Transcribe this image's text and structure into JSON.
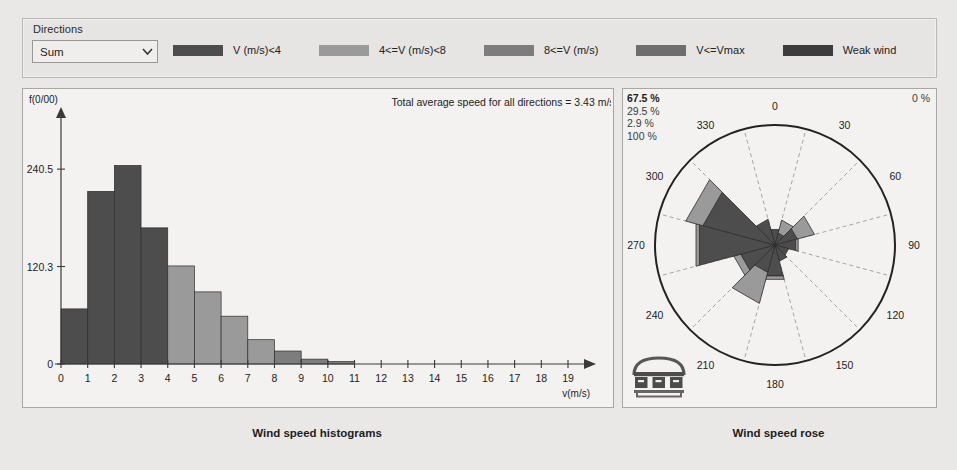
{
  "window": {
    "background": "#e9e8e6"
  },
  "controls": {
    "directions_label": "Directions",
    "direction_value": "Sum",
    "direction_options": [
      "Sum"
    ],
    "dropdown_icon": "chevron-down-icon"
  },
  "legend": {
    "items": [
      {
        "label": "V (m/s)<4",
        "color": "#4d4d4d"
      },
      {
        "label": "4<=V (m/s)<8",
        "color": "#9a9a9a"
      },
      {
        "label": "8<=V (m/s)",
        "color": "#7d7d7d"
      },
      {
        "label": "V<=Vmax",
        "color": "#6e6e6e"
      },
      {
        "label": "Weak wind",
        "color": "#3c3c3c"
      }
    ]
  },
  "histogram_panel": {
    "title": "Total average speed for all directions = 3.43 m/s",
    "caption": "Wind speed histograms"
  },
  "rose_panel": {
    "caption": "Wind speed rose",
    "stats": [
      "67.5 %",
      "29.5 %",
      "2.9 %",
      "100 %"
    ],
    "zero_label": "0 %",
    "logo_text": "mun"
  },
  "chart_data": [
    {
      "type": "bar",
      "title": "Total average speed for all directions = 3.43 m/s",
      "xlabel": "v(m/s)",
      "ylabel": "f(0/00)",
      "xlim": [
        0,
        19
      ],
      "ylim": [
        0,
        290
      ],
      "ytick_values": [
        0,
        120.3,
        240.5
      ],
      "ytick_labels": [
        "0",
        "120.3",
        "240.5"
      ],
      "xtick_values": [
        0,
        1,
        2,
        3,
        4,
        5,
        6,
        7,
        8,
        9,
        10,
        11,
        12,
        13,
        14,
        15,
        16,
        17,
        18,
        19
      ],
      "xtick_labels": [
        "0",
        "1",
        "2",
        "3",
        "4",
        "5",
        "6",
        "7",
        "8",
        "9",
        "10",
        "11",
        "12",
        "13",
        "14",
        "15",
        "16",
        "17",
        "18",
        "19"
      ],
      "grid": false,
      "bin_width": 1,
      "bins": [
        {
          "x0": 0,
          "x1": 1,
          "value": 68.0,
          "color": "#4d4d4d"
        },
        {
          "x0": 1,
          "x1": 2,
          "value": 213.0,
          "color": "#4d4d4d"
        },
        {
          "x0": 2,
          "x1": 3,
          "value": 245.0,
          "color": "#4d4d4d"
        },
        {
          "x0": 3,
          "x1": 4,
          "value": 168.0,
          "color": "#4d4d4d"
        },
        {
          "x0": 4,
          "x1": 5,
          "value": 121.0,
          "color": "#9a9a9a"
        },
        {
          "x0": 5,
          "x1": 6,
          "value": 89.0,
          "color": "#9a9a9a"
        },
        {
          "x0": 6,
          "x1": 7,
          "value": 59.0,
          "color": "#9a9a9a"
        },
        {
          "x0": 7,
          "x1": 8,
          "value": 30.0,
          "color": "#9a9a9a"
        },
        {
          "x0": 8,
          "x1": 9,
          "value": 16.0,
          "color": "#7d7d7d"
        },
        {
          "x0": 9,
          "x1": 10,
          "value": 6.0,
          "color": "#7d7d7d"
        },
        {
          "x0": 10,
          "x1": 11,
          "value": 3.0,
          "color": "#7d7d7d"
        }
      ]
    },
    {
      "type": "windrose",
      "title": "Wind speed rose",
      "direction_labels": [
        "0",
        "30",
        "60",
        "90",
        "120",
        "150",
        "180",
        "210",
        "240",
        "270",
        "300",
        "330"
      ],
      "sector_count": 12,
      "sector_width_deg": 30,
      "outer_ring_percent": 67.5,
      "rings": [
        "67.5 %",
        "29.5 %",
        "2.9 %",
        "100 %"
      ],
      "sectors": [
        {
          "direction": 0,
          "bands": [
            {
              "class": "V (m/s)<4",
              "value": 9.0,
              "color": "#4d4d4d"
            },
            {
              "class": "4<=V (m/s)<8",
              "value": 0.0,
              "color": "#9a9a9a"
            }
          ]
        },
        {
          "direction": 30,
          "bands": [
            {
              "class": "V (m/s)<4",
              "value": 7.0,
              "color": "#4d4d4d"
            },
            {
              "class": "4<=V (m/s)<8",
              "value": 7.5,
              "color": "#9a9a9a"
            }
          ]
        },
        {
          "direction": 60,
          "bands": [
            {
              "class": "V (m/s)<4",
              "value": 13.0,
              "color": "#4d4d4d"
            },
            {
              "class": "4<=V (m/s)<8",
              "value": 10.0,
              "color": "#9a9a9a"
            }
          ]
        },
        {
          "direction": 90,
          "bands": [
            {
              "class": "V (m/s)<4",
              "value": 12.0,
              "color": "#4d4d4d"
            },
            {
              "class": "4<=V (m/s)<8",
              "value": 1.5,
              "color": "#9a9a9a"
            }
          ]
        },
        {
          "direction": 120,
          "bands": [
            {
              "class": "V (m/s)<4",
              "value": 8.0,
              "color": "#4d4d4d"
            },
            {
              "class": "4<=V (m/s)<8",
              "value": 0.0,
              "color": "#9a9a9a"
            }
          ]
        },
        {
          "direction": 150,
          "bands": [
            {
              "class": "V (m/s)<4",
              "value": 9.5,
              "color": "#4d4d4d"
            },
            {
              "class": "4<=V (m/s)<8",
              "value": 0.0,
              "color": "#9a9a9a"
            }
          ]
        },
        {
          "direction": 180,
          "bands": [
            {
              "class": "V (m/s)<4",
              "value": 18.0,
              "color": "#4d4d4d"
            },
            {
              "class": "4<=V (m/s)<8",
              "value": 2.0,
              "color": "#9a9a9a"
            }
          ]
        },
        {
          "direction": 210,
          "bands": [
            {
              "class": "V (m/s)<4",
              "value": 16.0,
              "color": "#4d4d4d"
            },
            {
              "class": "4<=V (m/s)<8",
              "value": 18.0,
              "color": "#9a9a9a"
            }
          ]
        },
        {
          "direction": 240,
          "bands": [
            {
              "class": "V (m/s)<4",
              "value": 20.0,
              "color": "#4d4d4d"
            },
            {
              "class": "4<=V (m/s)<8",
              "value": 4.0,
              "color": "#9a9a9a"
            }
          ]
        },
        {
          "direction": 270,
          "bands": [
            {
              "class": "V (m/s)<4",
              "value": 44.0,
              "color": "#4d4d4d"
            },
            {
              "class": "4<=V (m/s)<8",
              "value": 2.0,
              "color": "#9a9a9a"
            }
          ]
        },
        {
          "direction": 300,
          "bands": [
            {
              "class": "V (m/s)<4",
              "value": 42.0,
              "color": "#4d4d4d"
            },
            {
              "class": "4<=V (m/s)<8",
              "value": 10.0,
              "color": "#9a9a9a"
            }
          ]
        },
        {
          "direction": 330,
          "bands": [
            {
              "class": "V (m/s)<4",
              "value": 15.0,
              "color": "#4d4d4d"
            },
            {
              "class": "4<=V (m/s)<8",
              "value": 0.0,
              "color": "#9a9a9a"
            }
          ]
        }
      ]
    }
  ]
}
